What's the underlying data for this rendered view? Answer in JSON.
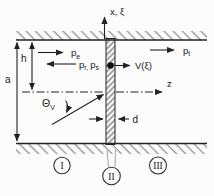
{
  "colors": {
    "background": "#fcfcfc",
    "line": "#222222",
    "text": "#1a1a1a",
    "wall_hatch": "#8a8a8a",
    "plate_hatch": "#4a4a4a",
    "region_leader": "#999999"
  },
  "axes": {
    "x_label": "x, ξ",
    "z_label": "z"
  },
  "labels": {
    "pe": {
      "main": "p",
      "sub": "e"
    },
    "pr": {
      "main": "p",
      "sub": "r"
    },
    "pr_ps_separator": ", ",
    "ps": {
      "main": "p",
      "sub": "s"
    },
    "pt": {
      "main": "p",
      "sub": "t"
    },
    "velocity": "V(ξ)",
    "angle": {
      "main": "Θ",
      "sub": "V"
    }
  },
  "dimensions": {
    "a": "a",
    "h": "h",
    "d": "d"
  },
  "regions": {
    "upstream": "I",
    "plate": "II",
    "downstream": "III"
  }
}
